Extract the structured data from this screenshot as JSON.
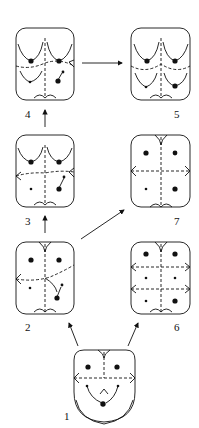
{
  "diagram": {
    "type": "developmental-sequence",
    "colors": {
      "ink": "#111111",
      "background": "#ffffff"
    },
    "panels": [
      {
        "id": "1",
        "label": "1"
      },
      {
        "id": "2",
        "label": "2"
      },
      {
        "id": "3",
        "label": "3"
      },
      {
        "id": "4",
        "label": "4"
      },
      {
        "id": "5",
        "label": "5"
      },
      {
        "id": "6",
        "label": "6"
      },
      {
        "id": "7",
        "label": "7"
      }
    ],
    "arrows": [
      {
        "from": "1",
        "to": "2"
      },
      {
        "from": "1",
        "to": "6"
      },
      {
        "from": "2",
        "to": "3"
      },
      {
        "from": "2",
        "to": "7"
      },
      {
        "from": "3",
        "to": "4"
      },
      {
        "from": "4",
        "to": "5"
      }
    ]
  }
}
